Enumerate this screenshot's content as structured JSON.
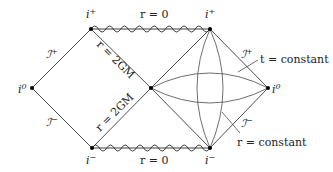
{
  "diagram": {
    "colors": {
      "line": "#3a3a3a",
      "dot": "#000000",
      "text": "#222222",
      "background": "#ffffff"
    },
    "points": {
      "i_plus_left": {
        "x": 91,
        "y": 29,
        "label": "i",
        "sup": "+"
      },
      "i_plus_right": {
        "x": 210,
        "y": 29,
        "label": "i",
        "sup": "+"
      },
      "i0_left": {
        "x": 32,
        "y": 88,
        "label": "i",
        "sup": "0"
      },
      "center": {
        "x": 151,
        "y": 88
      },
      "i0_right": {
        "x": 268,
        "y": 88,
        "label": "i",
        "sup": "0"
      },
      "i_minus_left": {
        "x": 92,
        "y": 148,
        "label": "i",
        "sup": "−"
      },
      "i_minus_right": {
        "x": 210,
        "y": 148,
        "label": "i",
        "sup": "−"
      }
    },
    "labels": {
      "singularity_top": "r = 0",
      "singularity_bottom": "r = 0",
      "horizon_upper": "r = 2GM",
      "horizon_lower": "r = 2GM",
      "scri_plus_left": {
        "main": "ℐ",
        "sup": "+"
      },
      "scri_minus_left": {
        "main": "ℐ",
        "sup": "−"
      },
      "scri_plus_right": {
        "main": "ℐ",
        "sup": "+"
      },
      "scri_minus_right": {
        "main": "ℐ",
        "sup": "−"
      },
      "t_constant": "t = constant",
      "r_constant": "r = constant"
    }
  }
}
